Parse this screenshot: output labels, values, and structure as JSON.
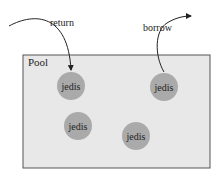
{
  "diagram": {
    "pool": {
      "label": "Pool",
      "fill": "#e8e8e8",
      "stroke": "#555555"
    },
    "connections": [
      {
        "label": "jedis",
        "cx": 71,
        "cy": 86
      },
      {
        "label": "jedis",
        "cx": 164,
        "cy": 87
      },
      {
        "label": "jedis",
        "cx": 78,
        "cy": 126
      },
      {
        "label": "jedis",
        "cx": 136,
        "cy": 136
      }
    ],
    "connection_fill": "#aaaaaa",
    "arrows": {
      "return": {
        "label": "return"
      },
      "borrow": {
        "label": "borrow"
      }
    }
  }
}
